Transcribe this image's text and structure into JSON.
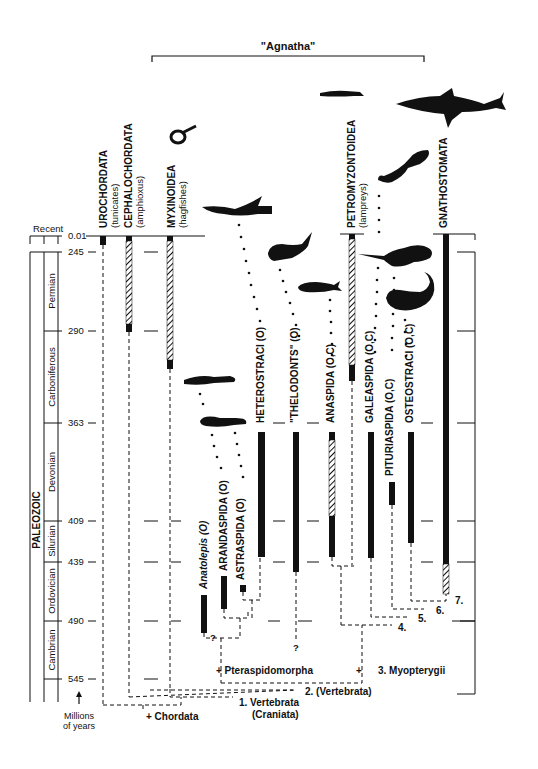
{
  "title": "\"Agnatha\"",
  "time_axis": {
    "recent_label": "Recent",
    "era_label": "PALEOZOIC",
    "units_label_line1": "Millions",
    "units_label_line2": "of years",
    "ticks": [
      {
        "value": "0.01",
        "y": 236
      },
      {
        "value": "245",
        "y": 252
      },
      {
        "value": "290",
        "y": 331
      },
      {
        "value": "363",
        "y": 423
      },
      {
        "value": "409",
        "y": 521
      },
      {
        "value": "439",
        "y": 562
      },
      {
        "value": "490",
        "y": 621
      },
      {
        "value": "545",
        "y": 679
      }
    ],
    "periods": [
      "Permian",
      "Carboniferous",
      "Devonian",
      "Silurian",
      "Ordovician",
      "Cambrian"
    ]
  },
  "taxa": {
    "urochordata": {
      "name": "UROCHORDATA",
      "common": "(tunicates)"
    },
    "cephalochordata": {
      "name": "CEPHALOCHORDATA",
      "common": "(amphioxus)"
    },
    "myxinoidea": {
      "name": "MYXINOIDEA",
      "common": "(hagfishes)"
    },
    "anatolepis": {
      "name": "Anatolepis (O)"
    },
    "arandaspida": {
      "name": "ARANDASPIDA (O)"
    },
    "astraspida": {
      "name": "ASTRASPIDA (O)"
    },
    "heterostraci": {
      "name": "HETEROSTRACI (O)"
    },
    "thelodonts": {
      "name": "\"THELODONTS\" (O)"
    },
    "anaspida": {
      "name": "ANASPIDA (O,C)"
    },
    "petromyzontoidea": {
      "name": "PETROMYZONTOIDEA",
      "common": "(lampreys)"
    },
    "galeaspida": {
      "name": "GALEASPIDA (O,C)"
    },
    "pituriaspida": {
      "name": "PITURIASPIDA (O,C)"
    },
    "osteostraci": {
      "name": "OSTEOSTRACI (O,C)"
    },
    "gnathostomata": {
      "name": "GNATHOSTOMATA"
    }
  },
  "nodes": {
    "chordata": "+ Chordata",
    "vertebrata_craniata_1": "1. Vertebrata",
    "vertebrata_craniata_2": "(Craniata)",
    "vertebrata_2": "2. (Vertebrata)",
    "pteraspidomorpha": "+ Pteraspidomorpha",
    "myopterygii": "3. Myopterygii",
    "n4": "4.",
    "n5": "5.",
    "n6": "6.",
    "n7": "7.",
    "q1": "?",
    "q2": "?"
  },
  "colors": {
    "ink": "#111111",
    "background": "#ffffff"
  }
}
